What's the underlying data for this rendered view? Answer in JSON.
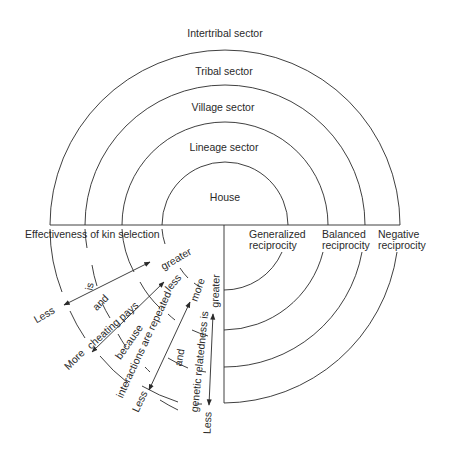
{
  "sectors": {
    "intertribal": "Intertribal sector",
    "tribal": "Tribal sector",
    "village": "Village sector",
    "lineage": "Lineage sector",
    "house": "House"
  },
  "reciprocity": {
    "generalized_1": "Generalized",
    "generalized_2": "reciprocity",
    "balanced_1": "Balanced",
    "balanced_2": "reciprocity",
    "negative_1": "Negative",
    "negative_2": "reciprocity"
  },
  "kin": {
    "title": "Effectiveness of kin selection",
    "is": "is",
    "less1": "Less",
    "greater1": "greater",
    "and1": "and",
    "cheating": "cheating pays",
    "more1": "More",
    "less2": "less",
    "because": "because",
    "interactions": "interactions are repeated",
    "less3": "Less",
    "more2": "more",
    "and2": "and",
    "genetic": "genetic relatedness is",
    "less4": "Less",
    "greater2": "greater"
  }
}
